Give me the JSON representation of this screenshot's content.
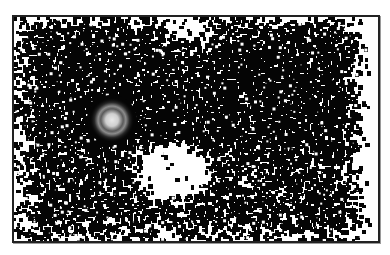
{
  "image": {
    "description": "Grayscale high-contrast field image: dense black speckle clusters filling a rectangular frame, a bright glowing point source on the left, and a white void below center",
    "frame": {
      "x": 12,
      "y": 15,
      "width": 364,
      "height": 224,
      "border_color": "#222222"
    },
    "background_color": "#ffffff",
    "speckle_color": "#050505",
    "bright_source": {
      "cx": 110,
      "cy": 118,
      "radius": 14,
      "core_color": "#e8e8e8",
      "halo_color": "#8c8c8c"
    },
    "void_region": {
      "cx": 170,
      "cy": 168,
      "rx": 38,
      "ry": 28
    },
    "density_seed": 7331
  }
}
